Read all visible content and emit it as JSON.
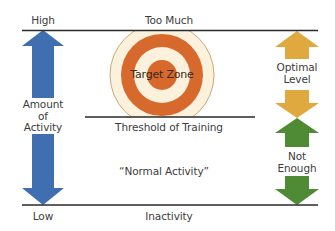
{
  "diagram": {
    "labels": {
      "high": "High",
      "low": "Low",
      "too_much": "Too Much",
      "threshold": "Threshold of Training",
      "normal_activity": "“Normal Activity”",
      "inactivity": "Inactivity",
      "target_zone": "Target Zone",
      "amount_line1": "Amount",
      "amount_line2": "of",
      "amount_line3": "Activity",
      "optimal_line1": "Optimal",
      "optimal_line2": "Level",
      "not_enough_line1": "Not",
      "not_enough_line2": "Enough"
    },
    "colors": {
      "blue_arrow": "#3f6fb1",
      "gold_arrow": "#e0a93f",
      "green_arrow": "#4f8a35",
      "target_orange": "#d8692c",
      "target_cream": "#fbf1dc",
      "target_outline": "#c9a878",
      "line": "#2a2a2a"
    }
  }
}
